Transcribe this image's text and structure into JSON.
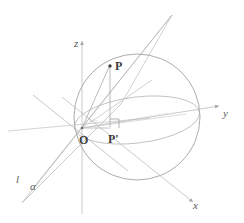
{
  "figure": {
    "width": 244,
    "height": 223,
    "background_color": "#ffffff"
  },
  "colors": {
    "sphere_outline": "#9a9a9a",
    "equator": "#b0b0b0",
    "axis": "#b8b8b8",
    "plane_lines": "#a8a8a8",
    "ray": "#bdbdbd",
    "dotted": "#c0c0c0",
    "label": "#3d3d3d",
    "accent": "#808080"
  },
  "labels": {
    "axis_z": "z",
    "axis_y": "y",
    "axis_x": "x",
    "origin": "O",
    "point_p": "P",
    "point_p_prime": "P'",
    "line_l": "l",
    "plane_alpha": "α"
  },
  "geometry": {
    "origin": {
      "x": 82,
      "y": 128
    },
    "sphere": {
      "cx": 137,
      "cy": 117,
      "r": 63
    },
    "equator": {
      "cx": 137,
      "cy": 120,
      "rx": 63,
      "ry": 23,
      "rotation": -7
    },
    "point_p": {
      "x": 110,
      "y": 66
    },
    "point_p_prime": {
      "x": 110,
      "y": 128
    },
    "right_angle_marker": {
      "x": 110,
      "y": 128,
      "size": 9
    },
    "z_axis": {
      "x1": 82,
      "y1": 40,
      "x2": 82,
      "y2": 214
    },
    "y_axis": {
      "x1": 82,
      "y1": 128,
      "x2": 222,
      "y2": 105
    },
    "x_axis": {
      "x1": 62,
      "y1": 97,
      "x2": 196,
      "y2": 205
    },
    "apex_top": {
      "x": 172,
      "y": 15
    },
    "apex_bottom_left": {
      "x": 22,
      "y": 203
    }
  },
  "elements": [
    {
      "name": "sphere-outline",
      "kind": "circle"
    },
    {
      "name": "equator-ellipse",
      "kind": "ellipse"
    },
    {
      "name": "z-axis",
      "kind": "arrow-line"
    },
    {
      "name": "y-axis",
      "kind": "arrow-line"
    },
    {
      "name": "x-axis",
      "kind": "arrow-line"
    },
    {
      "name": "plane-alpha",
      "kind": "polygon-outline"
    },
    {
      "name": "line-l",
      "kind": "line"
    },
    {
      "name": "segment-op",
      "kind": "line"
    },
    {
      "name": "segment-pp-prime",
      "kind": "line"
    },
    {
      "name": "segment-op-prime",
      "kind": "line"
    },
    {
      "name": "dotted-ray",
      "kind": "dotted-line"
    },
    {
      "name": "right-angle-marker",
      "kind": "square-marker"
    },
    {
      "name": "angle-arcs-at-origin",
      "kind": "arcs"
    }
  ]
}
